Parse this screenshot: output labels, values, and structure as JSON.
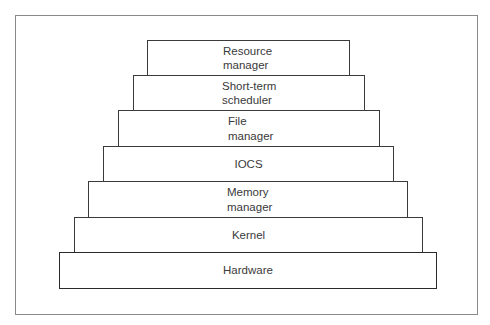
{
  "diagram": {
    "type": "layered-stack",
    "layers": [
      {
        "id": "resource-manager",
        "lines": [
          "Resource",
          "manager"
        ],
        "left": 147,
        "top": 40,
        "right": 350,
        "bottom": 76,
        "align": "left",
        "text_left": 222
      },
      {
        "id": "short-term-scheduler",
        "lines": [
          "Short-term",
          "scheduler"
        ],
        "left": 133,
        "top": 75,
        "right": 365,
        "bottom": 111,
        "align": "left",
        "text_left": 221
      },
      {
        "id": "file-manager",
        "lines": [
          "File",
          "manager"
        ],
        "left": 118,
        "top": 110,
        "right": 380,
        "bottom": 147,
        "align": "left",
        "text_left": 227
      },
      {
        "id": "iocs",
        "lines": [
          "IOCS"
        ],
        "left": 103,
        "top": 146,
        "right": 394,
        "bottom": 182,
        "align": "center"
      },
      {
        "id": "memory-manager",
        "lines": [
          "Memory",
          "manager"
        ],
        "left": 88,
        "top": 181,
        "right": 408,
        "bottom": 218,
        "align": "left",
        "text_left": 226
      },
      {
        "id": "kernel",
        "lines": [
          "Kernel"
        ],
        "left": 74,
        "top": 217,
        "right": 423,
        "bottom": 254,
        "align": "center"
      },
      {
        "id": "hardware",
        "lines": [
          "Hardware"
        ],
        "left": 59,
        "top": 252,
        "right": 437,
        "bottom": 289,
        "align": "center"
      }
    ]
  },
  "labels": {
    "resource_manager_1": "Resource",
    "resource_manager_2": "manager",
    "short_term_1": "Short-term",
    "short_term_2": "scheduler",
    "file_manager_1": "File",
    "file_manager_2": "manager",
    "iocs": "IOCS",
    "memory_manager_1": "Memory",
    "memory_manager_2": "manager",
    "kernel": "Kernel",
    "hardware": "Hardware"
  }
}
